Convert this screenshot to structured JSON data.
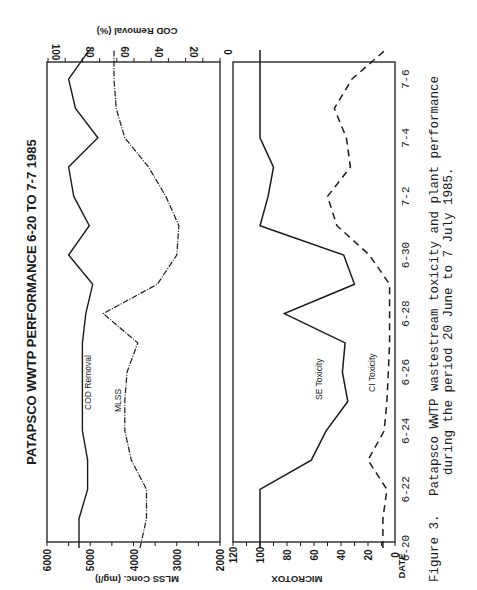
{
  "chart_data": [
    {
      "type": "line",
      "title": "PATAPSCO WWTP PERFORMANCE 6-20 TO 7-7 1985",
      "xlabel": "DATE",
      "x": [
        "6-20",
        "6-21",
        "6-22",
        "6-23",
        "6-24",
        "6-25",
        "6-26",
        "6-27",
        "6-28",
        "6-29",
        "6-30",
        "7-1",
        "7-2",
        "7-3",
        "7-4",
        "7-5",
        "7-6",
        "7-7"
      ],
      "x_tick_labels": [
        "6-20",
        "6-22",
        "6-24",
        "6-26",
        "6-28",
        "6-30",
        "7-2",
        "7-4",
        "7-6"
      ],
      "left_axis": {
        "label": "MLSS Conc. (mg/l)",
        "ylim": [
          2000,
          6000
        ],
        "ticks": [
          "6000",
          "5000",
          "4000",
          "3000",
          "2000"
        ]
      },
      "right_axis": {
        "label": "COD Removal (%)",
        "ylim": [
          0,
          100
        ],
        "ticks": [
          "100",
          "80",
          "60",
          "40",
          "20",
          "0"
        ]
      },
      "series": [
        {
          "name": "COD Removal",
          "axis": "right",
          "style": "solid",
          "values": [
            82,
            82,
            77,
            77,
            80,
            80,
            80,
            80,
            78,
            74,
            88,
            76,
            85,
            88,
            71,
            84,
            88,
            76
          ]
        },
        {
          "name": "MLSS",
          "axis": "left",
          "style": "dash-dot",
          "values": [
            3850,
            3700,
            3700,
            4050,
            4200,
            4200,
            4150,
            3900,
            4700,
            3450,
            3000,
            2950,
            3250,
            3650,
            4200,
            4400,
            4450,
            4450
          ]
        }
      ],
      "legend_labels": [
        "COD Removal",
        "MLSS"
      ]
    },
    {
      "type": "line",
      "xlabel": "DATE",
      "ylabel": "MICROTOX",
      "ylim": [
        0,
        120
      ],
      "y_ticks": [
        "120",
        "100",
        "80",
        "60",
        "40",
        "20",
        "0"
      ],
      "x": [
        "6-20",
        "6-21",
        "6-22",
        "6-23",
        "6-24",
        "6-25",
        "6-26",
        "6-27",
        "6-28",
        "6-29",
        "6-30",
        "7-1",
        "7-2",
        "7-3",
        "7-4",
        "7-5",
        "7-6",
        "7-7"
      ],
      "x_tick_labels": [
        "6-20",
        "6-22",
        "6-24",
        "6-26",
        "6-28",
        "6-30",
        "7-2",
        "7-4",
        "7-6"
      ],
      "series": [
        {
          "name": "SE Toxicity",
          "style": "solid",
          "values": [
            100,
            100,
            100,
            62,
            51,
            35,
            39,
            37,
            82,
            30,
            38,
            100,
            94,
            90,
            100,
            100,
            100,
            100
          ]
        },
        {
          "name": "CI Toxicity",
          "style": "dashed",
          "values": [
            9,
            9,
            6,
            20,
            8,
            6,
            5,
            4,
            4,
            4,
            19,
            43,
            50,
            33,
            36,
            45,
            32,
            7
          ]
        }
      ],
      "legend_labels": [
        "SE Toxicity",
        "CI Toxicity"
      ]
    }
  ],
  "figure": {
    "title": "PATAPSCO WWTP PERFORMANCE 6-20 TO 7-7 1985",
    "upper_panel": {
      "left_axis_label": "MLSS Conc. (mg/l)",
      "right_axis_label": "COD Removal (%)",
      "left_ticks": [
        "6000",
        "5000",
        "4000",
        "3000",
        "2000"
      ],
      "right_ticks": [
        "100",
        "80",
        "60",
        "40",
        "20",
        "0"
      ],
      "series_labels": {
        "cod": "COD Removal",
        "mlss": "MLSS"
      }
    },
    "lower_panel": {
      "axis_label": "MICROTOX",
      "ticks": [
        "120",
        "100",
        "80",
        "60",
        "40",
        "20",
        "0"
      ],
      "series_labels": {
        "se": "SE Toxicity",
        "ci": "CI Toxicity"
      }
    },
    "date_axis_label": "DATE",
    "date_ticks": [
      "6-20",
      "6-22",
      "6-24",
      "6-26",
      "6-28",
      "6-30",
      "7-2",
      "7-4",
      "7-6"
    ],
    "caption": {
      "number": "Figure 3.",
      "line1": "Patapsco WWTP wastestream toxicity and plant performance",
      "line2": "during the period 20 June to 7 July 1985."
    },
    "colors": {
      "ink": "#1a1a1a",
      "paper": "#ffffff"
    }
  }
}
